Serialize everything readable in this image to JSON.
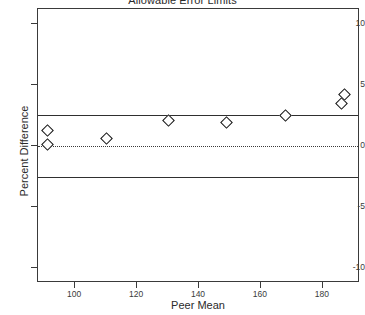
{
  "chart_data": {
    "type": "scatter",
    "title": "Allowable Error Limits",
    "xlabel": "Peer Mean",
    "ylabel": "Percent Difference",
    "xlim": [
      88,
      192
    ],
    "ylim": [
      -11.2,
      11.2
    ],
    "xticks": [
      100,
      120,
      140,
      160,
      180
    ],
    "yticks": [
      10,
      5,
      0,
      -5,
      -10
    ],
    "xticklabels": [
      "100",
      "120",
      "140",
      "160",
      "180"
    ],
    "yticklabels": [
      "10",
      "5",
      "0",
      "-5",
      "-10"
    ],
    "grid": false,
    "legend": false,
    "marker": "open-diamond",
    "points": [
      {
        "x": 91,
        "y": 1.3
      },
      {
        "x": 91,
        "y": 0.1
      },
      {
        "x": 110,
        "y": 0.6
      },
      {
        "x": 130,
        "y": 2.1
      },
      {
        "x": 149,
        "y": 1.9
      },
      {
        "x": 168,
        "y": 2.5
      },
      {
        "x": 186,
        "y": 3.5
      },
      {
        "x": 187,
        "y": 4.2
      }
    ],
    "reference_lines": [
      {
        "name": "upper-allowable-error-limit",
        "y": 2.5,
        "style": "solid"
      },
      {
        "name": "zero-difference-line",
        "y": 0.0,
        "style": "dotted"
      },
      {
        "name": "lower-allowable-error-limit",
        "y": -2.5,
        "style": "solid"
      }
    ],
    "colors": {
      "axis": "#3a3a3a",
      "marker_edge": "#111111",
      "marker_fill": "#ffffff",
      "limit_line": "#2f2f2f",
      "background": "#ffffff"
    }
  }
}
